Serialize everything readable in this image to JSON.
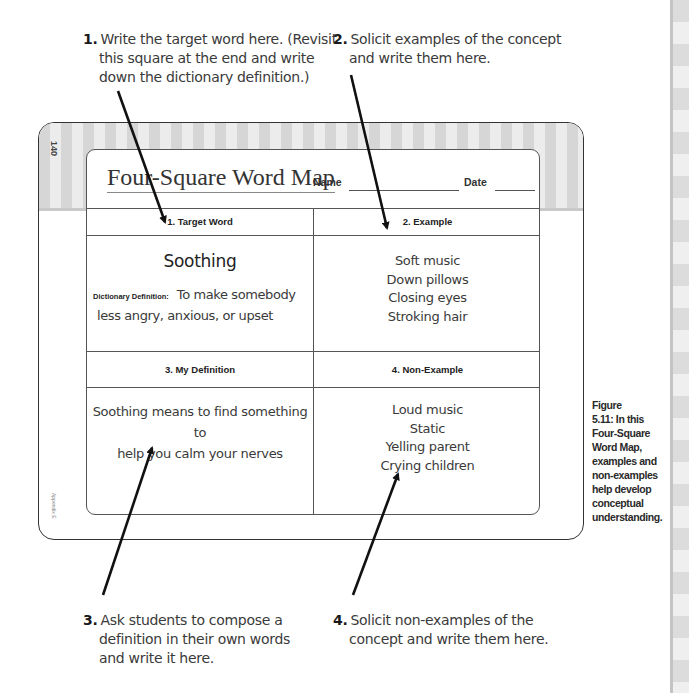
{
  "callouts": [
    {
      "number": "1.",
      "lines": [
        "Write the target word here. (Revisit",
        "this square at the end and write",
        "down the dictionary definition.)"
      ]
    },
    {
      "number": "2.",
      "lines": [
        "Solicit examples of the concept",
        "and write them here."
      ]
    },
    {
      "number": "3.",
      "lines": [
        "Ask students to compose a",
        "definition in their own words",
        "and write it here."
      ]
    },
    {
      "number": "4.",
      "lines": [
        "Solicit non-examples of the",
        "concept and write them here."
      ]
    }
  ],
  "form": {
    "page_number": "140",
    "appendix_label": "Appendix E",
    "title": "Four-Square Word Map",
    "name_label": "Name",
    "date_label": "Date",
    "squares": [
      {
        "header": "1. Target Word",
        "word": "Soothing",
        "definition_label": "Dictionary Definition:",
        "definition_lines": [
          "To make somebody",
          "less angry, anxious, or upset"
        ]
      },
      {
        "header": "2. Example",
        "items": [
          "Soft music",
          "Down pillows",
          "Closing eyes",
          "Stroking hair"
        ]
      },
      {
        "header": "3. My Definition",
        "lines": [
          "Soothing means to find something to",
          "help you calm your nerves"
        ]
      },
      {
        "header": "4. Non-Example",
        "items": [
          "Loud music",
          "Static",
          "Yelling parent",
          "Crying children"
        ]
      }
    ]
  },
  "caption": {
    "lines": [
      "Figure",
      "5.11: In this",
      "Four-Square",
      "Word Map,",
      "examples and",
      "non-examples",
      "help develop",
      "conceptual",
      "understanding."
    ]
  }
}
